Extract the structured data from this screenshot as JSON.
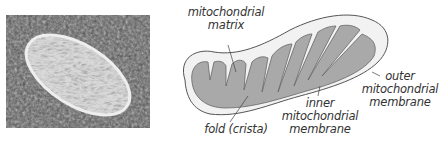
{
  "figure": {
    "photo_alt": "electron micrograph of a mitochondrion",
    "labels": {
      "matrix": [
        "mitochondrial",
        "matrix"
      ],
      "fold": "fold (crista)",
      "inner": [
        "inner",
        "mitochondrial",
        "membrane"
      ],
      "outer": [
        "outer",
        "mitochondrial",
        "membrane"
      ]
    },
    "colors": {
      "outer_fill": "#f2f2f2",
      "inner_fill": "#a9a9a9",
      "outline": "#555555",
      "text": "#333333"
    }
  }
}
